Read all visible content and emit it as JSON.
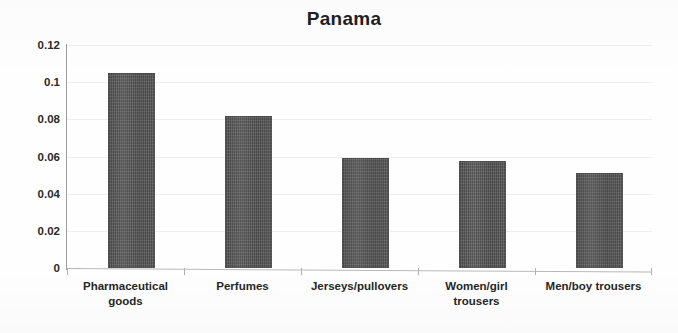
{
  "chart_data": {
    "type": "bar",
    "title": "Panama",
    "xlabel": "",
    "ylabel": "",
    "categories": [
      "Pharmaceutical goods",
      "Perfumes",
      "Jerseys/pullovers",
      "Women/girl trousers",
      "Men/boy trousers"
    ],
    "category_lines": [
      [
        "Pharmaceutical",
        "goods"
      ],
      [
        "Perfumes"
      ],
      [
        "Jerseys/pullovers"
      ],
      [
        "Women/girl",
        "trousers"
      ],
      [
        "Men/boy trousers"
      ]
    ],
    "values": [
      0.105,
      0.082,
      0.059,
      0.0575,
      0.051
    ],
    "ylim": [
      0,
      0.12
    ],
    "yticks": [
      0,
      0.02,
      0.04,
      0.06,
      0.08,
      0.1,
      0.12
    ],
    "ytick_labels": [
      "0",
      "0.02",
      "0.04",
      "0.06",
      "0.08",
      "0.1",
      "0.12"
    ],
    "grid": true,
    "legend": false,
    "bar_color": "#565656",
    "background_color": "#ffffff",
    "gridline_color": "#ededf2",
    "axis_color": "#9d9d9d",
    "title_color": "#1f1f1f"
  }
}
